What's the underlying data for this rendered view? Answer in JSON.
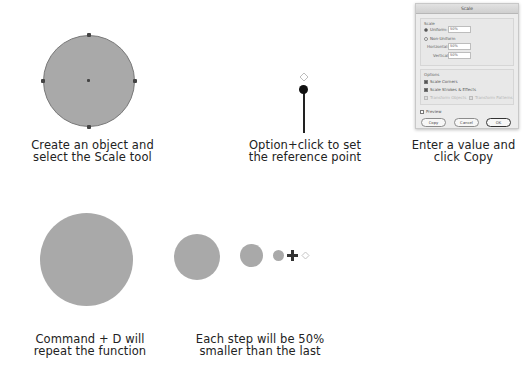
{
  "steps": [
    {
      "id": "step1",
      "caption": [
        "Create an object and",
        "select the Scale tool"
      ]
    },
    {
      "id": "step2",
      "caption": [
        "Option+click to set",
        "the reference point"
      ]
    },
    {
      "id": "step3",
      "caption": [
        "Enter a value and",
        "click Copy"
      ]
    },
    {
      "id": "step4",
      "caption": [
        "Command + D will",
        "repeat the function"
      ]
    },
    {
      "id": "step5",
      "caption": [
        "Each step will be 50%",
        "smaller than the last"
      ]
    }
  ],
  "colors": {
    "circle_fill": "#a9a9a9",
    "anchor": "#444444",
    "text": "#222222"
  },
  "scale_dialog": {
    "title": "Scale",
    "scale_section_label": "Scale",
    "uniform_label": "Uniform:",
    "uniform_value": "50%",
    "uniform_selected": true,
    "non_uniform_label": "Non-Uniform",
    "horizontal_label": "Horizontal:",
    "horizontal_value": "50%",
    "vertical_label": "Vertical:",
    "vertical_value": "50%",
    "options_label": "Options",
    "scale_corners_label": "Scale Corners",
    "scale_corners_checked": true,
    "scale_strokes_label": "Scale Strokes & Effects",
    "scale_strokes_checked": true,
    "transform_objects_label": "Transform Objects",
    "transform_patterns_label": "Transform Patterns",
    "preview_label": "Preview",
    "preview_checked": false,
    "buttons": {
      "copy": "Copy",
      "cancel": "Cancel",
      "ok": "OK"
    }
  },
  "repeat_sequence": {
    "sizes_px": [
      92,
      46,
      23,
      11
    ],
    "step_reduction": "50%"
  }
}
